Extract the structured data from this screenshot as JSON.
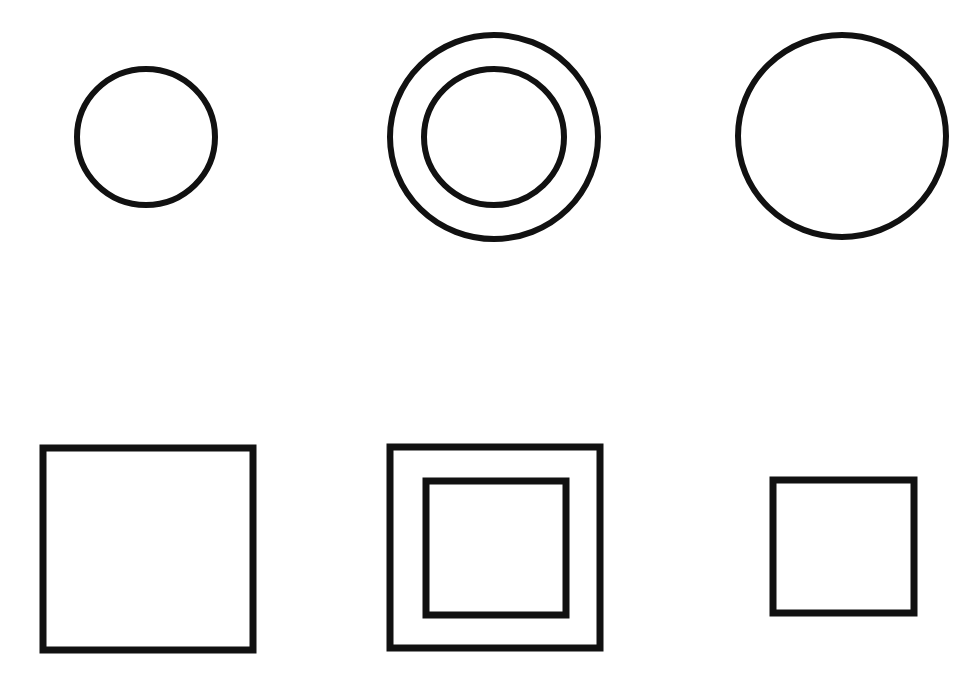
{
  "figure": {
    "background": "#ffffff",
    "stroke_color": "#111111",
    "rows": [
      {
        "name": "circles",
        "items": [
          {
            "kind": "circle",
            "label": "single-small-circle",
            "cx": 146,
            "cy": 137,
            "rx": 69,
            "ry": 68,
            "stroke_width": 6
          },
          {
            "kind": "concentric-circles",
            "label": "double-circle",
            "outer": {
              "cx": 494,
              "cy": 137,
              "rx": 104,
              "ry": 102,
              "stroke_width": 6
            },
            "inner": {
              "cx": 494,
              "cy": 137,
              "rx": 70,
              "ry": 68,
              "stroke_width": 6
            }
          },
          {
            "kind": "circle",
            "label": "single-large-circle",
            "cx": 842,
            "cy": 136,
            "rx": 104,
            "ry": 101,
            "stroke_width": 6
          }
        ]
      },
      {
        "name": "squares",
        "items": [
          {
            "kind": "square",
            "label": "single-large-square",
            "x": 43,
            "y": 448,
            "w": 210,
            "h": 202,
            "stroke_width": 7
          },
          {
            "kind": "concentric-squares",
            "label": "double-square",
            "outer": {
              "x": 390,
              "y": 447,
              "w": 210,
              "h": 201,
              "stroke_width": 7
            },
            "inner": {
              "x": 426,
              "y": 481,
              "w": 140,
              "h": 134,
              "stroke_width": 7
            }
          },
          {
            "kind": "square",
            "label": "single-small-square",
            "x": 773,
            "y": 480,
            "w": 141,
            "h": 133,
            "stroke_width": 7
          }
        ]
      }
    ]
  }
}
